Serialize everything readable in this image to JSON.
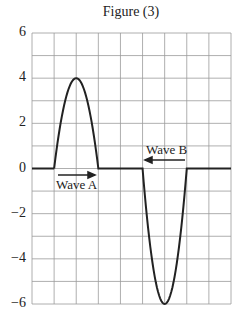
{
  "chart_data": {
    "type": "line",
    "title": "Figure (3)",
    "xlabel": "",
    "ylabel": "",
    "ylim": [
      -6,
      6
    ],
    "xlim": [
      0,
      9
    ],
    "grid": true,
    "yticks": [
      "6",
      "4",
      "2",
      "0",
      "−2",
      "−4",
      "−6"
    ],
    "series": [
      {
        "name": "Wave A",
        "shape": "upward pulse",
        "x": [
          1,
          2,
          3
        ],
        "y": [
          0,
          4,
          0
        ],
        "direction": "right",
        "color": "#222222"
      },
      {
        "name": "Wave B",
        "shape": "downward pulse",
        "x": [
          5,
          6,
          7
        ],
        "y": [
          0,
          -6,
          0
        ],
        "direction": "left",
        "color": "#222222"
      }
    ],
    "annotations": [
      {
        "text": "Wave A",
        "arrow": "right"
      },
      {
        "text": "Wave B",
        "arrow": "left"
      }
    ]
  }
}
